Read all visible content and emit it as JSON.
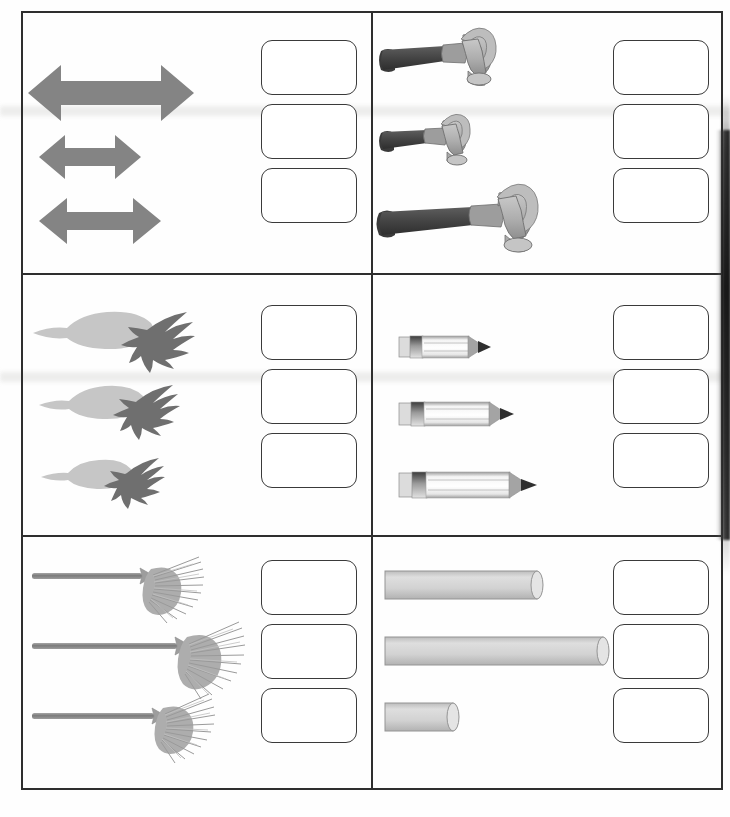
{
  "worksheet": {
    "title": "Comparing Lengths Worksheet",
    "layout": {
      "columns": 2,
      "rows": 3,
      "cells": 6
    },
    "answer_box": {
      "count_per_cell": 3,
      "value": "",
      "placeholder": ""
    },
    "colors": {
      "border": "#2e2e2e",
      "box_border": "#3a3a3a",
      "arrow_gray": "#828282",
      "hammer_handle": "#4d4d4d",
      "hammer_head": "#b0b0b0",
      "carrot_body": "#c2c2c2",
      "carrot_leaf": "#6e6e6e",
      "pencil_body": "#f2f2f2",
      "pencil_ferrule": "#5a5a5a",
      "pencil_tip": "#9a9a9a",
      "broom_handle": "#8a8a8a",
      "broom_bristle": "#a8a8a8",
      "cylinder_fill": "#d0d0d0",
      "page_background": "#fefefe"
    },
    "cells": [
      {
        "id": "cell-arrows",
        "object_name": "double-headed arrow",
        "position": "top-left",
        "items": [
          {
            "index": 1,
            "length_px": 170,
            "rank": "longest"
          },
          {
            "index": 2,
            "length_px": 56,
            "rank": "shortest"
          },
          {
            "index": 3,
            "length_px": 80,
            "rank": "middle"
          }
        ]
      },
      {
        "id": "cell-hammers",
        "object_name": "claw hammer",
        "position": "top-right",
        "items": [
          {
            "index": 1,
            "length_px": 150,
            "rank": "middle"
          },
          {
            "index": 2,
            "length_px": 115,
            "rank": "shortest"
          },
          {
            "index": 3,
            "length_px": 200,
            "rank": "longest"
          }
        ]
      },
      {
        "id": "cell-carrots",
        "object_name": "carrot",
        "position": "middle-left",
        "items": [
          {
            "index": 1,
            "length_px": 200,
            "rank": "longest"
          },
          {
            "index": 2,
            "length_px": 175,
            "rank": "middle"
          },
          {
            "index": 3,
            "length_px": 145,
            "rank": "shortest"
          }
        ]
      },
      {
        "id": "cell-pencils",
        "object_name": "pencil",
        "position": "middle-right",
        "items": [
          {
            "index": 1,
            "length_px": 92,
            "rank": "shortest"
          },
          {
            "index": 2,
            "length_px": 115,
            "rank": "middle"
          },
          {
            "index": 3,
            "length_px": 140,
            "rank": "longest"
          }
        ]
      },
      {
        "id": "cell-brooms",
        "object_name": "broom",
        "position": "bottom-left",
        "items": [
          {
            "index": 1,
            "length_px": 155,
            "rank": "middle"
          },
          {
            "index": 2,
            "length_px": 195,
            "rank": "longest"
          },
          {
            "index": 3,
            "length_px": 165,
            "rank": "shortest"
          }
        ]
      },
      {
        "id": "cell-cylinders",
        "object_name": "cylinder",
        "position": "bottom-right",
        "items": [
          {
            "index": 1,
            "length_px": 160,
            "rank": "middle"
          },
          {
            "index": 2,
            "length_px": 220,
            "rank": "longest"
          },
          {
            "index": 3,
            "length_px": 75,
            "rank": "shortest"
          }
        ]
      }
    ]
  }
}
